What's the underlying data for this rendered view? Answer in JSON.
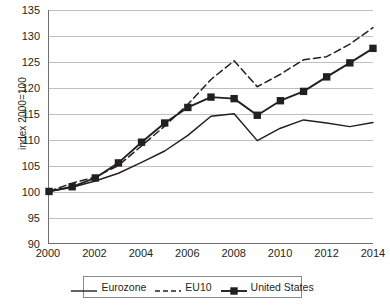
{
  "chart_data": {
    "type": "line",
    "title": "",
    "xlabel": "",
    "ylabel": "index 2000=100",
    "xlim": [
      2000,
      2014
    ],
    "ylim": [
      90,
      135
    ],
    "grid": true,
    "legend_position": "bottom",
    "x": [
      2000,
      2001,
      2002,
      2003,
      2004,
      2005,
      2006,
      2007,
      2008,
      2009,
      2010,
      2011,
      2012,
      2013,
      2014
    ],
    "x_tick_labels": [
      "2000",
      "2002",
      "2004",
      "2006",
      "2008",
      "2010",
      "2012",
      "2014"
    ],
    "y_tick_labels": [
      "90",
      "95",
      "100",
      "105",
      "110",
      "115",
      "120",
      "125",
      "130",
      "135"
    ],
    "series": [
      {
        "name": "Eurozone",
        "style": "solid",
        "marker": "none",
        "color": "#231f20",
        "values": [
          100.0,
          100.8,
          102.0,
          103.5,
          105.6,
          107.8,
          110.8,
          114.5,
          115.0,
          109.8,
          112.2,
          113.8,
          113.2,
          112.5,
          113.3
        ]
      },
      {
        "name": "EU10",
        "style": "dashed",
        "marker": "none",
        "color": "#231f20",
        "values": [
          100.0,
          101.6,
          102.8,
          105.0,
          108.8,
          112.6,
          116.8,
          121.6,
          125.2,
          120.2,
          122.6,
          125.4,
          126.0,
          128.4,
          131.6
        ]
      },
      {
        "name": "United States",
        "style": "solid",
        "marker": "square",
        "color": "#231f20",
        "values": [
          100.0,
          100.9,
          102.6,
          105.5,
          109.5,
          113.2,
          116.2,
          118.2,
          117.9,
          114.7,
          117.5,
          119.3,
          122.1,
          124.8,
          127.6
        ]
      }
    ]
  },
  "legend": {
    "items": [
      {
        "label": "Eurozone"
      },
      {
        "label": "EU10"
      },
      {
        "label": "United States"
      }
    ]
  }
}
